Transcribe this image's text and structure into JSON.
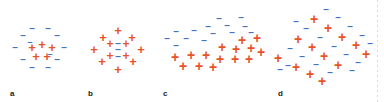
{
  "figure": {
    "width": 384,
    "height": 102,
    "background": "#ffffff"
  },
  "colors": {
    "plus": "#E8542A",
    "minus": "#4472C4",
    "label": "#1a1a1a",
    "background": "#ffffff"
  },
  "symbols": {
    "plus": "+",
    "minus": "–"
  },
  "panels": [
    {
      "id": "a",
      "label": "a",
      "label_x": 10,
      "left": 0,
      "width": 82,
      "arrangement": "positive core surrounded by negative shell",
      "plus_count": 5,
      "minus_count": 12,
      "charges": [
        {
          "type": "minus",
          "x": 32,
          "y": 29,
          "size": 10,
          "rot": 0
        },
        {
          "type": "minus",
          "x": 48,
          "y": 29,
          "size": 10,
          "rot": 0
        },
        {
          "type": "minus",
          "x": 23,
          "y": 36,
          "size": 10,
          "rot": 0
        },
        {
          "type": "minus",
          "x": 57,
          "y": 36,
          "size": 10,
          "rot": 0
        },
        {
          "type": "minus",
          "x": 15,
          "y": 48,
          "size": 10,
          "rot": 0
        },
        {
          "type": "minus",
          "x": 64,
          "y": 48,
          "size": 10,
          "rot": 0
        },
        {
          "type": "minus",
          "x": 23,
          "y": 60,
          "size": 10,
          "rot": 0
        },
        {
          "type": "minus",
          "x": 57,
          "y": 60,
          "size": 10,
          "rot": 0
        },
        {
          "type": "minus",
          "x": 32,
          "y": 68,
          "size": 10,
          "rot": 0
        },
        {
          "type": "minus",
          "x": 48,
          "y": 68,
          "size": 10,
          "rot": 0
        },
        {
          "type": "minus",
          "x": 30,
          "y": 42,
          "size": 9,
          "rot": 0
        },
        {
          "type": "minus",
          "x": 50,
          "y": 54,
          "size": 9,
          "rot": 0
        },
        {
          "type": "plus",
          "x": 32,
          "y": 47,
          "size": 13,
          "rot": 0
        },
        {
          "type": "plus",
          "x": 42,
          "y": 44,
          "size": 13,
          "rot": 0
        },
        {
          "type": "plus",
          "x": 52,
          "y": 47,
          "size": 13,
          "rot": 0
        },
        {
          "type": "plus",
          "x": 36,
          "y": 56,
          "size": 13,
          "rot": 0
        },
        {
          "type": "plus",
          "x": 47,
          "y": 56,
          "size": 13,
          "rot": 0
        }
      ]
    },
    {
      "id": "b",
      "label": "b",
      "label_x": 88,
      "left": 82,
      "width": 74,
      "arrangement": "negative core surrounded by positive shell",
      "plus_count": 12,
      "minus_count": 3,
      "charges": [
        {
          "type": "plus",
          "x": 36,
          "y": 30,
          "size": 13,
          "rot": 0
        },
        {
          "type": "plus",
          "x": 21,
          "y": 37,
          "size": 13,
          "rot": 0
        },
        {
          "type": "plus",
          "x": 50,
          "y": 37,
          "size": 13,
          "rot": 0
        },
        {
          "type": "plus",
          "x": 12,
          "y": 49,
          "size": 13,
          "rot": 0
        },
        {
          "type": "plus",
          "x": 59,
          "y": 49,
          "size": 13,
          "rot": 0
        },
        {
          "type": "plus",
          "x": 20,
          "y": 61,
          "size": 13,
          "rot": 0
        },
        {
          "type": "plus",
          "x": 51,
          "y": 61,
          "size": 13,
          "rot": 0
        },
        {
          "type": "plus",
          "x": 36,
          "y": 69,
          "size": 13,
          "rot": 0
        },
        {
          "type": "plus",
          "x": 28,
          "y": 44,
          "size": 12,
          "rot": 0
        },
        {
          "type": "plus",
          "x": 44,
          "y": 44,
          "size": 12,
          "rot": 0
        },
        {
          "type": "plus",
          "x": 28,
          "y": 56,
          "size": 12,
          "rot": 0
        },
        {
          "type": "plus",
          "x": 44,
          "y": 56,
          "size": 12,
          "rot": 0
        },
        {
          "type": "minus",
          "x": 36,
          "y": 44,
          "size": 10,
          "rot": 0
        },
        {
          "type": "minus",
          "x": 36,
          "y": 50,
          "size": 10,
          "rot": 0
        },
        {
          "type": "minus",
          "x": 36,
          "y": 57,
          "size": 10,
          "rot": 0
        }
      ]
    },
    {
      "id": "c",
      "label": "c",
      "label_x": 163,
      "left": 156,
      "width": 110,
      "arrangement": "diagonally separated layers, negatives above positives",
      "plus_count": 14,
      "minus_count": 14,
      "charges": [
        {
          "type": "minus",
          "x": 63,
          "y": 19,
          "size": 10,
          "rot": 0
        },
        {
          "type": "minus",
          "x": 85,
          "y": 18,
          "size": 10,
          "rot": 0
        },
        {
          "type": "minus",
          "x": 52,
          "y": 27,
          "size": 10,
          "rot": 0
        },
        {
          "type": "minus",
          "x": 71,
          "y": 26,
          "size": 10,
          "rot": 0
        },
        {
          "type": "minus",
          "x": 89,
          "y": 27,
          "size": 10,
          "rot": 0
        },
        {
          "type": "minus",
          "x": 20,
          "y": 32,
          "size": 10,
          "rot": 0
        },
        {
          "type": "minus",
          "x": 38,
          "y": 31,
          "size": 10,
          "rot": 0
        },
        {
          "type": "minus",
          "x": 57,
          "y": 34,
          "size": 10,
          "rot": 0
        },
        {
          "type": "minus",
          "x": 76,
          "y": 33,
          "size": 10,
          "rot": 0
        },
        {
          "type": "minus",
          "x": 95,
          "y": 33,
          "size": 10,
          "rot": 0
        },
        {
          "type": "minus",
          "x": 11,
          "y": 39,
          "size": 10,
          "rot": 0
        },
        {
          "type": "minus",
          "x": 30,
          "y": 39,
          "size": 10,
          "rot": 0
        },
        {
          "type": "minus",
          "x": 48,
          "y": 41,
          "size": 10,
          "rot": 0
        },
        {
          "type": "minus",
          "x": 20,
          "y": 46,
          "size": 10,
          "rot": 0
        },
        {
          "type": "plus",
          "x": 86,
          "y": 40,
          "size": 14,
          "rot": 0
        },
        {
          "type": "plus",
          "x": 101,
          "y": 38,
          "size": 14,
          "rot": 0
        },
        {
          "type": "plus",
          "x": 66,
          "y": 47,
          "size": 14,
          "rot": 0
        },
        {
          "type": "plus",
          "x": 80,
          "y": 49,
          "size": 14,
          "rot": 0
        },
        {
          "type": "plus",
          "x": 95,
          "y": 48,
          "size": 14,
          "rot": 0
        },
        {
          "type": "plus",
          "x": 105,
          "y": 52,
          "size": 14,
          "rot": 0
        },
        {
          "type": "plus",
          "x": 19,
          "y": 57,
          "size": 14,
          "rot": 0
        },
        {
          "type": "plus",
          "x": 35,
          "y": 55,
          "size": 14,
          "rot": 0
        },
        {
          "type": "plus",
          "x": 50,
          "y": 55,
          "size": 14,
          "rot": 0
        },
        {
          "type": "plus",
          "x": 64,
          "y": 59,
          "size": 14,
          "rot": 0
        },
        {
          "type": "plus",
          "x": 79,
          "y": 59,
          "size": 14,
          "rot": 0
        },
        {
          "type": "plus",
          "x": 93,
          "y": 59,
          "size": 14,
          "rot": 0
        },
        {
          "type": "plus",
          "x": 27,
          "y": 66,
          "size": 14,
          "rot": 0
        },
        {
          "type": "plus",
          "x": 43,
          "y": 66,
          "size": 14,
          "rot": 0
        },
        {
          "type": "plus",
          "x": 57,
          "y": 67,
          "size": 14,
          "rot": 0
        }
      ]
    },
    {
      "id": "d",
      "label": "d",
      "label_x": 278,
      "left": 266,
      "width": 118,
      "arrangement": "intermixed positives and negatives in a diamond cluster",
      "plus_count": 15,
      "minus_count": 16,
      "charges": [
        {
          "type": "minus",
          "x": 60,
          "y": 10,
          "size": 10,
          "rot": 0
        },
        {
          "type": "plus",
          "x": 48,
          "y": 19,
          "size": 14,
          "rot": 0
        },
        {
          "type": "minus",
          "x": 72,
          "y": 18,
          "size": 10,
          "rot": 0
        },
        {
          "type": "minus",
          "x": 40,
          "y": 29,
          "size": 10,
          "rot": 0
        },
        {
          "type": "plus",
          "x": 62,
          "y": 28,
          "size": 14,
          "rot": 0
        },
        {
          "type": "minus",
          "x": 84,
          "y": 27,
          "size": 10,
          "rot": 0
        },
        {
          "type": "plus",
          "x": 32,
          "y": 39,
          "size": 14,
          "rot": 0
        },
        {
          "type": "minus",
          "x": 54,
          "y": 38,
          "size": 10,
          "rot": 0
        },
        {
          "type": "plus",
          "x": 76,
          "y": 37,
          "size": 14,
          "rot": 0
        },
        {
          "type": "minus",
          "x": 96,
          "y": 36,
          "size": 10,
          "rot": 0
        },
        {
          "type": "minus",
          "x": 24,
          "y": 49,
          "size": 10,
          "rot": 0
        },
        {
          "type": "plus",
          "x": 46,
          "y": 47,
          "size": 14,
          "rot": 0
        },
        {
          "type": "minus",
          "x": 68,
          "y": 47,
          "size": 10,
          "rot": 0
        },
        {
          "type": "plus",
          "x": 90,
          "y": 45,
          "size": 14,
          "rot": 0
        },
        {
          "type": "plus",
          "x": 12,
          "y": 58,
          "size": 14,
          "rot": 0
        },
        {
          "type": "minus",
          "x": 36,
          "y": 57,
          "size": 10,
          "rot": 0
        },
        {
          "type": "plus",
          "x": 58,
          "y": 56,
          "size": 14,
          "rot": 0
        },
        {
          "type": "minus",
          "x": 80,
          "y": 55,
          "size": 10,
          "rot": 0
        },
        {
          "type": "plus",
          "x": 100,
          "y": 54,
          "size": 14,
          "rot": 0
        },
        {
          "type": "minus",
          "x": 22,
          "y": 66,
          "size": 10,
          "rot": 0
        },
        {
          "type": "plus",
          "x": 30,
          "y": 67,
          "size": 14,
          "rot": 0
        },
        {
          "type": "minus",
          "x": 50,
          "y": 65,
          "size": 10,
          "rot": 0
        },
        {
          "type": "plus",
          "x": 72,
          "y": 65,
          "size": 14,
          "rot": 0
        },
        {
          "type": "minus",
          "x": 92,
          "y": 63,
          "size": 10,
          "rot": 0
        },
        {
          "type": "plus",
          "x": 44,
          "y": 74,
          "size": 14,
          "rot": 0
        },
        {
          "type": "minus",
          "x": 64,
          "y": 73,
          "size": 10,
          "rot": 0
        },
        {
          "type": "minus",
          "x": 14,
          "y": 70,
          "size": 10,
          "rot": 0
        },
        {
          "type": "plus",
          "x": 56,
          "y": 81,
          "size": 14,
          "rot": 0
        },
        {
          "type": "minus",
          "x": 104,
          "y": 44,
          "size": 10,
          "rot": 0
        },
        {
          "type": "minus",
          "x": 30,
          "y": 22,
          "size": 10,
          "rot": 0
        },
        {
          "type": "minus",
          "x": 86,
          "y": 71,
          "size": 10,
          "rot": 0
        }
      ]
    }
  ]
}
